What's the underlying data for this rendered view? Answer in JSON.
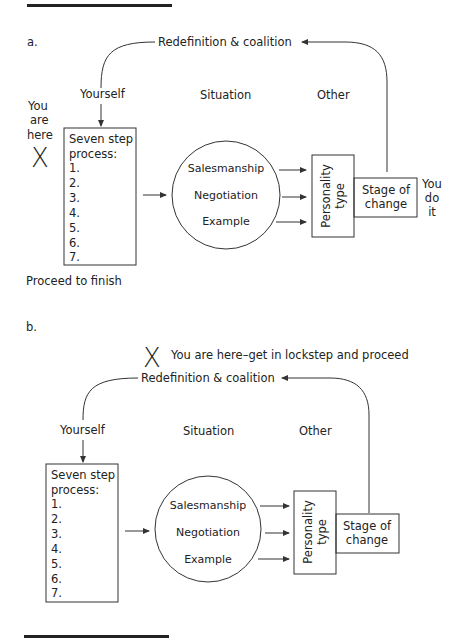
{
  "panel_a": {
    "label": "a.",
    "loop_label": "Redefinition & coalition",
    "col_yourself": "Yourself",
    "col_situation": "Situation",
    "col_other": "Other",
    "marker": "X",
    "you_are_here": [
      "You",
      "are",
      "here"
    ],
    "process_box": {
      "title_line1": "Seven step",
      "title_line2": "process:",
      "steps": [
        "1.",
        "2.",
        "3.",
        "4.",
        "5.",
        "6.",
        "7."
      ]
    },
    "circle_items": [
      "Salesmanship",
      "Negotiation",
      "Example"
    ],
    "personality_box": [
      "Personality",
      "type"
    ],
    "stage_box": [
      "Stage of",
      "change"
    ],
    "you_do_it": [
      "You",
      "do",
      "it"
    ],
    "footer": "Proceed to finish"
  },
  "panel_b": {
    "label": "b.",
    "marker": "X",
    "marker_text": "You are here–get in lockstep and proceed",
    "loop_label": "Redefinition & coalition",
    "col_yourself": "Yourself",
    "col_situation": "Situation",
    "col_other": "Other",
    "process_box": {
      "title_line1": "Seven step",
      "title_line2": "process:",
      "steps": [
        "1.",
        "2.",
        "3.",
        "4.",
        "5.",
        "6.",
        "7."
      ]
    },
    "circle_items": [
      "Salesmanship",
      "Negotiation",
      "Example"
    ],
    "personality_box": [
      "Personality",
      "type"
    ],
    "stage_box": [
      "Stage of",
      "change"
    ]
  }
}
